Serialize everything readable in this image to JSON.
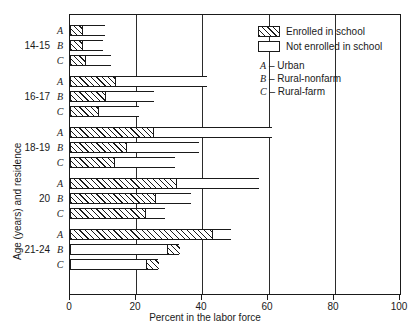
{
  "chart_data": {
    "type": "bar",
    "orientation": "horizontal",
    "stacked": true,
    "title": "",
    "xlabel": "Percent in the labor force",
    "ylabel": "Age (years) and residence",
    "xlim": [
      0,
      100
    ],
    "xticks": [
      0,
      20,
      40,
      60,
      80,
      100
    ],
    "xtick_labels": [
      "0",
      "20",
      "40",
      "60",
      "80",
      "100"
    ],
    "grid": "vertical gridlines at 20, 40, 60, 80",
    "legend_position": "upper right inside plot",
    "series": [
      {
        "name": "Enrolled in school",
        "fill": "hatched-diagonal"
      },
      {
        "name": "Not enrolled in school",
        "fill": "white"
      }
    ],
    "residence_keys": [
      {
        "key": "A",
        "label": "Urban"
      },
      {
        "key": "B",
        "label": "Rural-nonfarm"
      },
      {
        "key": "C",
        "label": "Rural-farm"
      }
    ],
    "groups": [
      {
        "age": "14-15",
        "rows": [
          {
            "key": "A",
            "enrolled": 3.6,
            "not_enrolled": 6.9,
            "total": 10.5,
            "order": "enrolled-first"
          },
          {
            "key": "B",
            "enrolled": 3.6,
            "not_enrolled": 6.4,
            "total": 10.0,
            "order": "enrolled-first"
          },
          {
            "key": "C",
            "enrolled": 4.5,
            "not_enrolled": 7.8,
            "total": 12.3,
            "order": "enrolled-first"
          }
        ]
      },
      {
        "age": "16-17",
        "rows": [
          {
            "key": "A",
            "enrolled": 13.5,
            "not_enrolled": 28.0,
            "total": 41.5,
            "order": "enrolled-first"
          },
          {
            "key": "B",
            "enrolled": 10.5,
            "not_enrolled": 15.1,
            "total": 25.6,
            "order": "enrolled-first"
          },
          {
            "key": "C",
            "enrolled": 8.5,
            "not_enrolled": 12.5,
            "total": 21.0,
            "order": "enrolled-first"
          }
        ]
      },
      {
        "age": "18-19",
        "rows": [
          {
            "key": "A",
            "enrolled": 25.3,
            "not_enrolled": 35.8,
            "total": 61.1,
            "order": "enrolled-first"
          },
          {
            "key": "B",
            "enrolled": 17.0,
            "not_enrolled": 22.0,
            "total": 39.0,
            "order": "enrolled-first"
          },
          {
            "key": "C",
            "enrolled": 13.2,
            "not_enrolled": 18.7,
            "total": 31.9,
            "order": "enrolled-first"
          }
        ]
      },
      {
        "age": "20",
        "rows": [
          {
            "key": "A",
            "enrolled": 32.0,
            "not_enrolled": 25.2,
            "total": 57.2,
            "order": "enrolled-first"
          },
          {
            "key": "B",
            "enrolled": 25.8,
            "not_enrolled": 10.9,
            "total": 36.7,
            "order": "enrolled-first"
          },
          {
            "key": "C",
            "enrolled": 22.6,
            "not_enrolled": 6.2,
            "total": 28.8,
            "order": "enrolled-first"
          }
        ]
      },
      {
        "age": "21-24",
        "rows": [
          {
            "key": "A",
            "enrolled": 43.0,
            "not_enrolled": 5.8,
            "total": 48.8,
            "order": "enrolled-first"
          },
          {
            "key": "B",
            "enrolled": 3.5,
            "not_enrolled": 29.5,
            "total": 33.0,
            "order": "not-enrolled-first"
          },
          {
            "key": "C",
            "enrolled": 3.6,
            "not_enrolled": 23.0,
            "total": 26.6,
            "order": "not-enrolled-first"
          }
        ]
      }
    ]
  },
  "axis": {
    "x_title": "Percent in the labor force",
    "y_title": "Age (years) and residence",
    "x_tick_labels": [
      "0",
      "20",
      "40",
      "60",
      "80",
      "100"
    ]
  },
  "legend": {
    "enrolled_label": "Enrolled in school",
    "not_enrolled_label": "Not enrolled in school",
    "keys": [
      {
        "letter": "A",
        "dash": "–",
        "label": "Urban"
      },
      {
        "letter": "B",
        "dash": "–",
        "label": "Rural-nonfarm"
      },
      {
        "letter": "C",
        "dash": "–",
        "label": "Rural-farm"
      }
    ]
  },
  "colors": {
    "ink": "#1a1a1a",
    "paper": "#ffffff"
  }
}
